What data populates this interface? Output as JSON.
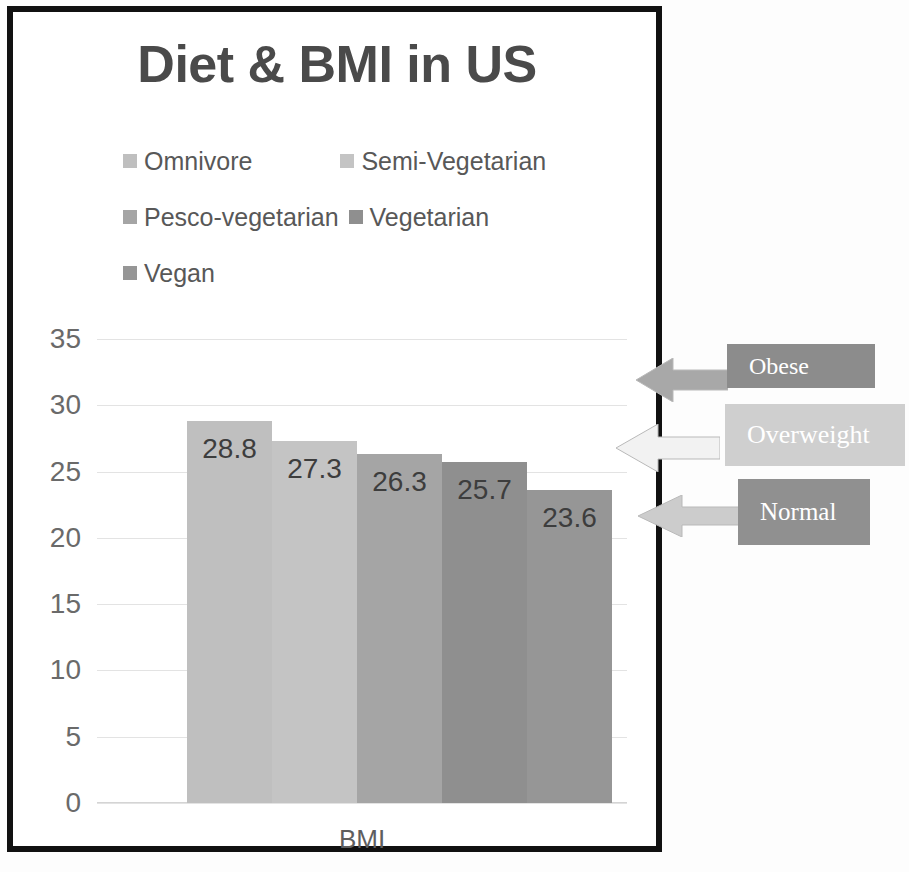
{
  "chart_data": {
    "type": "bar",
    "title": "Diet & BMI in US",
    "xlabel": "BMI",
    "ylabel": "",
    "categories": [
      "Omnivore",
      "Semi-Vegetarian",
      "Pesco-vegetarian",
      "Vegetarian",
      "Vegan"
    ],
    "values": [
      28.8,
      27.3,
      26.3,
      25.7,
      23.6
    ],
    "value_labels": [
      "28.8",
      "27.3",
      "26.3",
      "25.7",
      "23.6"
    ],
    "bar_colors": [
      "#bfbfbf",
      "#c4c4c4",
      "#a5a5a5",
      "#8f8f8f",
      "#969696"
    ],
    "ylim": [
      0,
      35
    ],
    "yticks": [
      35,
      30,
      25,
      20,
      15,
      10,
      5,
      0
    ],
    "ytick_labels": [
      "35",
      "30",
      "25",
      "20",
      "15",
      "10",
      "5",
      "0"
    ],
    "grid": true,
    "legend_position": "top",
    "legend": [
      {
        "label": "Omnivore",
        "color": "#bfbfbf"
      },
      {
        "label": "Semi-Vegetarian",
        "color": "#c4c4c4"
      },
      {
        "label": "Pesco-vegetarian",
        "color": "#a5a5a5"
      },
      {
        "label": "Vegetarian",
        "color": "#8f8f8f"
      },
      {
        "label": "Vegan",
        "color": "#969696"
      }
    ],
    "annotations": [
      {
        "label": "Obese",
        "box_color": "#8c8c8c",
        "arrow_color": "#a8a8a8",
        "points_to_value": 30
      },
      {
        "label": "Overweight",
        "box_color": "#cfcfcf",
        "arrow_color": "#f2f2f2",
        "points_to_value": 26
      },
      {
        "label": "Normal",
        "box_color": "#909090",
        "arrow_color": "#cccccc",
        "points_to_value": 22
      }
    ]
  },
  "legend_rows": [
    [
      {
        "label": "Omnivore",
        "color": "#bfbfbf"
      },
      {
        "label": "Semi-Vegetarian",
        "color": "#c4c4c4"
      }
    ],
    [
      {
        "label": "Pesco-vegetarian",
        "color": "#a5a5a5"
      },
      {
        "label": "Vegetarian",
        "color": "#8f8f8f"
      }
    ],
    [
      {
        "label": "Vegan",
        "color": "#969696"
      }
    ]
  ],
  "frame": {
    "border_color": "#111111"
  }
}
